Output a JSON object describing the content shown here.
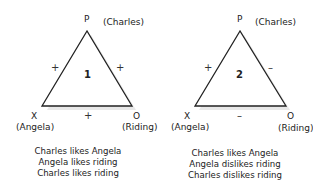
{
  "diagrams": [
    {
      "number": "1",
      "vertices": {
        "top": {
          "letter": "P",
          "name": "(Charles)"
        },
        "left": {
          "letter": "X",
          "name": "(Angela)"
        },
        "right": {
          "letter": "O",
          "name": "(Riding)"
        }
      },
      "edges": {
        "left": "+",
        "right": "+",
        "bottom": "+"
      },
      "captions": [
        "Charles likes Angela",
        "Angela likes riding",
        "Charles likes riding"
      ]
    },
    {
      "number": "2",
      "vertices": {
        "top": {
          "letter": "P",
          "name": "(Charles)"
        },
        "left": {
          "letter": "X",
          "name": "(Angela)"
        },
        "right": {
          "letter": "O",
          "name": "(Riding)"
        }
      },
      "edges": {
        "left": "+",
        "right": "–",
        "bottom": "–"
      },
      "captions": [
        "Charles likes Angela",
        "Angela dislikes riding",
        "Charles dislikes riding"
      ]
    }
  ]
}
